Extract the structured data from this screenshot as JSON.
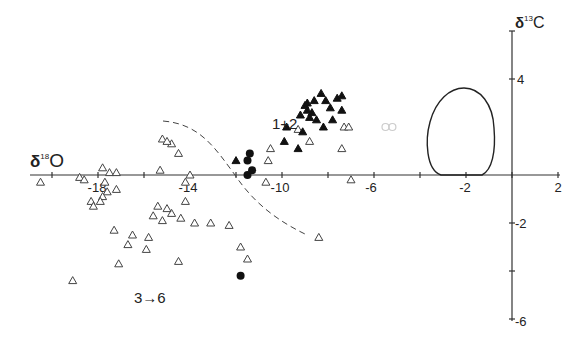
{
  "chart_data": {
    "type": "scatter",
    "title": "",
    "xlabel": "δ18O",
    "ylabel": "δ13C",
    "xlabel_parts": {
      "delta": "δ",
      "sup": "18",
      "el": "O"
    },
    "ylabel_parts": {
      "delta": "δ",
      "sup": "13",
      "el": "C"
    },
    "xlim": [
      -21,
      2
    ],
    "ylim": [
      -6,
      6
    ],
    "x_ticks": [
      -20,
      -18,
      -16,
      -14,
      -12,
      -10,
      -8,
      -6,
      -4,
      -2,
      0,
      2
    ],
    "x_tick_labels": [
      {
        "value": -18,
        "label": "-18"
      },
      {
        "value": -14,
        "label": "-14"
      },
      {
        "value": -10,
        "label": "-10"
      },
      {
        "value": -6,
        "label": "-6"
      },
      {
        "value": -2,
        "label": "-2"
      },
      {
        "value": 2,
        "label": "2"
      }
    ],
    "y_ticks": [
      4,
      -2,
      -4,
      -6
    ],
    "y_tick_labels": [
      {
        "value": 4,
        "label": "4"
      },
      {
        "value": -2,
        "label": "-2"
      },
      {
        "value": -6,
        "label": "-6"
      }
    ],
    "grid": false,
    "annotations": [
      {
        "text": "1+2",
        "x": -10.3,
        "y": 2.0
      },
      {
        "text": "3→6",
        "x": -16.2,
        "y": -6.3
      }
    ],
    "series": [
      {
        "name": "open triangles (3→6)",
        "marker": "open-triangle",
        "points": [
          [
            -20.5,
            -0.3
          ],
          [
            -18.8,
            -0.1
          ],
          [
            -18.6,
            -0.2
          ],
          [
            -17.8,
            0.3
          ],
          [
            -17.5,
            0.1
          ],
          [
            -17.2,
            0.1
          ],
          [
            -17.7,
            -0.3
          ],
          [
            -17.6,
            -0.7
          ],
          [
            -17.8,
            -0.9
          ],
          [
            -17.9,
            -1.1
          ],
          [
            -18.3,
            -1.1
          ],
          [
            -18.2,
            -1.3
          ],
          [
            -17.2,
            -0.6
          ],
          [
            -15.3,
            0.2
          ],
          [
            -14.2,
            -1.1
          ],
          [
            -15.4,
            -1.3
          ],
          [
            -14.8,
            -1.6
          ],
          [
            -14.4,
            -1.8
          ],
          [
            -13.1,
            -2.0
          ],
          [
            -12.3,
            -2.1
          ],
          [
            -15.2,
            -1.9
          ],
          [
            -15.0,
            -1.4
          ],
          [
            -15.6,
            -1.7
          ],
          [
            -14.0,
            0.0
          ],
          [
            -15.2,
            1.5
          ],
          [
            -14.8,
            1.3
          ],
          [
            -15.0,
            1.4
          ],
          [
            -16.5,
            -2.5
          ],
          [
            -15.8,
            -2.6
          ],
          [
            -17.3,
            -2.3
          ],
          [
            -16.7,
            -2.9
          ],
          [
            -15.9,
            -3.1
          ],
          [
            -17.1,
            -3.7
          ],
          [
            -14.5,
            -3.6
          ],
          [
            -19.1,
            -4.4
          ],
          [
            -11.8,
            -3.0
          ],
          [
            -11.5,
            -3.5
          ],
          [
            -8.4,
            -2.6
          ],
          [
            -10.6,
            0.6
          ],
          [
            -10.5,
            1.1
          ],
          [
            -9.3,
            1.9
          ],
          [
            -8.8,
            1.4
          ],
          [
            -10.7,
            -0.3
          ],
          [
            -7.4,
            1.1
          ],
          [
            -7.3,
            2.0
          ],
          [
            -7.1,
            2.0
          ],
          [
            -7.0,
            -0.2
          ],
          [
            -14.2,
            -0.3
          ],
          [
            -14.5,
            0.9
          ],
          [
            -13.8,
            -2.0
          ]
        ]
      },
      {
        "name": "filled triangles (1+2)",
        "marker": "filled-triangle",
        "points": [
          [
            -12.0,
            0.6
          ],
          [
            -9.8,
            2.0
          ],
          [
            -9.2,
            2.5
          ],
          [
            -9.0,
            2.9
          ],
          [
            -8.9,
            3.0
          ],
          [
            -8.6,
            3.1
          ],
          [
            -8.3,
            3.4
          ],
          [
            -8.1,
            3.1
          ],
          [
            -7.9,
            2.8
          ],
          [
            -7.6,
            3.2
          ],
          [
            -8.8,
            2.4
          ],
          [
            -8.5,
            2.3
          ],
          [
            -9.1,
            1.8
          ],
          [
            -8.2,
            2.0
          ],
          [
            -7.8,
            2.3
          ],
          [
            -9.9,
            1.4
          ],
          [
            -9.3,
            1.1
          ],
          [
            -7.4,
            3.3
          ],
          [
            -7.4,
            2.7
          ],
          [
            -8.9,
            2.7
          ],
          [
            -8.7,
            2.6
          ]
        ]
      },
      {
        "name": "filled circles",
        "marker": "filled-circle",
        "points": [
          [
            -11.4,
            0.9
          ],
          [
            -11.5,
            0.6
          ],
          [
            -11.3,
            0.2
          ],
          [
            -11.5,
            0.0
          ],
          [
            -11.8,
            -4.2
          ]
        ]
      },
      {
        "name": "faint open circles",
        "marker": "faint-circle",
        "points": [
          [
            -5.5,
            2.0
          ],
          [
            -5.2,
            2.0
          ]
        ]
      }
    ],
    "shapes": [
      {
        "name": "egg-envelope",
        "type": "closed-curve",
        "x_range": [
          -3.7,
          -0.7
        ],
        "y_range": [
          0.0,
          3.6
        ]
      },
      {
        "name": "dashed-boundary",
        "type": "dashed-curve",
        "from": [
          -15.3,
          2.2
        ],
        "to": [
          -9.0,
          -2.5
        ]
      }
    ]
  },
  "labels": {
    "x_axis_delta": "δ",
    "x_axis_sup": "18",
    "x_axis_el": "O",
    "y_axis_delta": "δ",
    "y_axis_sup": "13",
    "y_axis_el": "C",
    "annot_12": "1+2",
    "annot_36": "3→6",
    "tick_x_m18": "-18",
    "tick_x_m14": "-14",
    "tick_x_m10": "-10",
    "tick_x_m6": "-6",
    "tick_x_m2": "-2",
    "tick_x_2": "2",
    "tick_y_4": "4",
    "tick_y_m2": "-2",
    "tick_y_m6": "-6"
  }
}
